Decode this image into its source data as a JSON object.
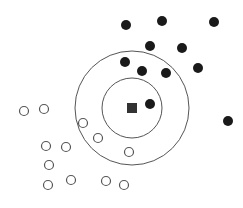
{
  "diagram": {
    "type": "knn-classification",
    "colors": {
      "background": "#ffffff",
      "filled": "#1a1a1a",
      "hollow_stroke": "#555555",
      "ring_stroke": "#555555",
      "query": "#333333"
    },
    "query_point": {
      "shape": "square",
      "x": 132,
      "y": 108,
      "size": 10
    },
    "rings": [
      {
        "name": "inner-ring",
        "cx": 132,
        "cy": 108,
        "r": 30
      },
      {
        "name": "outer-ring",
        "cx": 132,
        "cy": 108,
        "r": 57
      }
    ],
    "filled_points": [
      {
        "x": 126,
        "y": 25
      },
      {
        "x": 162,
        "y": 21
      },
      {
        "x": 214,
        "y": 22
      },
      {
        "x": 150,
        "y": 46
      },
      {
        "x": 182,
        "y": 48
      },
      {
        "x": 125,
        "y": 62
      },
      {
        "x": 142,
        "y": 71
      },
      {
        "x": 166,
        "y": 73
      },
      {
        "x": 198,
        "y": 68
      },
      {
        "x": 150,
        "y": 104
      },
      {
        "x": 228,
        "y": 121
      }
    ],
    "hollow_points": [
      {
        "x": 24,
        "y": 111
      },
      {
        "x": 44,
        "y": 109
      },
      {
        "x": 83,
        "y": 123
      },
      {
        "x": 98,
        "y": 138
      },
      {
        "x": 46,
        "y": 146
      },
      {
        "x": 66,
        "y": 147
      },
      {
        "x": 129,
        "y": 152
      },
      {
        "x": 49,
        "y": 165
      },
      {
        "x": 48,
        "y": 185
      },
      {
        "x": 71,
        "y": 180
      },
      {
        "x": 106,
        "y": 181
      },
      {
        "x": 124,
        "y": 185
      }
    ],
    "point_radius": 5
  }
}
